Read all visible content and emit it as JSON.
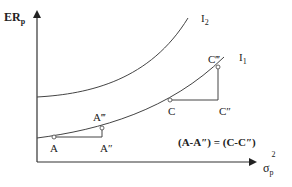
{
  "diagram": {
    "y_axis_label": "ER",
    "y_axis_label_sub": "p",
    "x_axis_label": "σ",
    "x_axis_label_sub": "p",
    "x_axis_label_sup": "2",
    "curves": [
      {
        "name": "I2",
        "label": "I",
        "label_sub": "2"
      },
      {
        "name": "I1",
        "label": "I",
        "label_sub": "1"
      }
    ],
    "points": {
      "A": "A",
      "A_double_prime": "A″",
      "A_triple_prime": "A‴",
      "C": "C",
      "C_double_prime": "C″",
      "C_triple_prime": "C‴"
    },
    "equation": "(A-A″) = (C-C″)",
    "colors": {
      "line": "#333333",
      "text": "#222222",
      "background": "#ffffff"
    }
  }
}
